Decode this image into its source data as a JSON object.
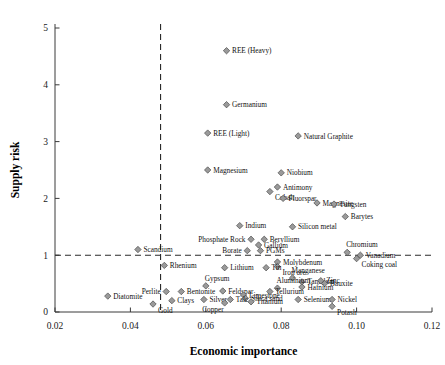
{
  "chart_data": {
    "type": "scatter",
    "title": "",
    "xlabel": "Economic importance",
    "ylabel": "Supply risk",
    "xlim": [
      0.02,
      0.12
    ],
    "ylim": [
      0,
      5
    ],
    "xticks": [
      0.02,
      0.04,
      0.06,
      0.08,
      0.1,
      0.12
    ],
    "xticklabels": [
      "0.02",
      "0.04",
      "0.06",
      "0.08",
      "0.10",
      "0.12"
    ],
    "yticks": [
      0,
      1,
      2,
      3,
      4,
      5
    ],
    "yticklabels": [
      "0",
      "1",
      "2",
      "3",
      "4",
      "5"
    ],
    "grid": false,
    "legend": "none",
    "marker": {
      "shape": "diamond",
      "fill": "#9a9a9a",
      "edge": "#4a4a4a"
    },
    "reference_lines": [
      {
        "orientation": "vertical",
        "value": 0.048,
        "style": "dashed"
      },
      {
        "orientation": "horizontal",
        "value": 1.0,
        "style": "dashed"
      }
    ],
    "points": [
      {
        "label": "REE (Heavy)",
        "x": 0.0655,
        "y": 4.6,
        "lab_pos": "right"
      },
      {
        "label": "Germanium",
        "x": 0.0655,
        "y": 3.65,
        "lab_pos": "right"
      },
      {
        "label": "REE (Light)",
        "x": 0.0605,
        "y": 3.15,
        "lab_pos": "right"
      },
      {
        "label": "Natural Graphite",
        "x": 0.0845,
        "y": 3.1,
        "lab_pos": "right"
      },
      {
        "label": "Magnesium",
        "x": 0.0605,
        "y": 2.5,
        "lab_pos": "right"
      },
      {
        "label": "Niobium",
        "x": 0.08,
        "y": 2.45,
        "lab_pos": "right"
      },
      {
        "label": "Antimony",
        "x": 0.079,
        "y": 2.2,
        "lab_pos": "right"
      },
      {
        "label": "Cobalt",
        "x": 0.077,
        "y": 2.12,
        "lab_pos": "belowright"
      },
      {
        "label": "Fluorspar",
        "x": 0.0805,
        "y": 2.0,
        "lab_pos": "right"
      },
      {
        "label": "Magnesite",
        "x": 0.0895,
        "y": 1.92,
        "lab_pos": "right"
      },
      {
        "label": "Tungsten",
        "x": 0.094,
        "y": 1.9,
        "lab_pos": "right"
      },
      {
        "label": "Barytes",
        "x": 0.097,
        "y": 1.68,
        "lab_pos": "right"
      },
      {
        "label": "Indium",
        "x": 0.069,
        "y": 1.52,
        "lab_pos": "right"
      },
      {
        "label": "Silicon metal",
        "x": 0.083,
        "y": 1.5,
        "lab_pos": "right"
      },
      {
        "label": "Phosphate Rock",
        "x": 0.072,
        "y": 1.28,
        "lab_pos": "left"
      },
      {
        "label": "Beryllium",
        "x": 0.0755,
        "y": 1.28,
        "lab_pos": "right"
      },
      {
        "label": "Gallium",
        "x": 0.074,
        "y": 1.18,
        "lab_pos": "right"
      },
      {
        "label": "Borate",
        "x": 0.071,
        "y": 1.08,
        "lab_pos": "left"
      },
      {
        "label": "PGMs",
        "x": 0.0745,
        "y": 1.08,
        "lab_pos": "right"
      },
      {
        "label": "Scandium",
        "x": 0.042,
        "y": 1.1,
        "lab_pos": "right"
      },
      {
        "label": "Chromium",
        "x": 0.0975,
        "y": 1.05,
        "lab_pos": "aboveright"
      },
      {
        "label": "Vanadium",
        "x": 0.101,
        "y": 1.0,
        "lab_pos": "right"
      },
      {
        "label": "Coking coal",
        "x": 0.1,
        "y": 0.94,
        "lab_pos": "belowright"
      },
      {
        "label": "Molybdenum",
        "x": 0.079,
        "y": 0.88,
        "lab_pos": "right"
      },
      {
        "label": "Iron ore",
        "x": 0.079,
        "y": 0.8,
        "lab_pos": "belowright"
      },
      {
        "label": "Tin",
        "x": 0.076,
        "y": 0.78,
        "lab_pos": "right"
      },
      {
        "label": "Rhenium",
        "x": 0.049,
        "y": 0.82,
        "lab_pos": "right"
      },
      {
        "label": "Lithium",
        "x": 0.065,
        "y": 0.78,
        "lab_pos": "right"
      },
      {
        "label": "Manganese",
        "x": 0.083,
        "y": 0.6,
        "lab_pos": "aboveright"
      },
      {
        "label": "Tantalum",
        "x": 0.0855,
        "y": 0.53,
        "lab_pos": "right"
      },
      {
        "label": "Zinc",
        "x": 0.0905,
        "y": 0.55,
        "lab_pos": "right"
      },
      {
        "label": "Bauxite",
        "x": 0.0915,
        "y": 0.5,
        "lab_pos": "right"
      },
      {
        "label": "Hafnium",
        "x": 0.0855,
        "y": 0.44,
        "lab_pos": "right"
      },
      {
        "label": "Aluminium",
        "x": 0.079,
        "y": 0.42,
        "lab_pos": "aboveright"
      },
      {
        "label": "Tellurium",
        "x": 0.077,
        "y": 0.36,
        "lab_pos": "right"
      },
      {
        "label": "Gypsum",
        "x": 0.06,
        "y": 0.46,
        "lab_pos": "aboveright"
      },
      {
        "label": "Feldspar",
        "x": 0.0645,
        "y": 0.37,
        "lab_pos": "right"
      },
      {
        "label": "Perlite",
        "x": 0.0495,
        "y": 0.36,
        "lab_pos": "left"
      },
      {
        "label": "Bentonite",
        "x": 0.0535,
        "y": 0.36,
        "lab_pos": "right"
      },
      {
        "label": "Limestone",
        "x": 0.07,
        "y": 0.3,
        "lab_pos": "right"
      },
      {
        "label": "Silica sand",
        "x": 0.0705,
        "y": 0.24,
        "lab_pos": "right"
      },
      {
        "label": "Silver",
        "x": 0.0595,
        "y": 0.22,
        "lab_pos": "right"
      },
      {
        "label": "Talc",
        "x": 0.0665,
        "y": 0.22,
        "lab_pos": "right"
      },
      {
        "label": "Clays",
        "x": 0.051,
        "y": 0.2,
        "lab_pos": "right"
      },
      {
        "label": "Copper",
        "x": 0.065,
        "y": 0.16,
        "lab_pos": "belowleft"
      },
      {
        "label": "Gold",
        "x": 0.046,
        "y": 0.14,
        "lab_pos": "belowright"
      },
      {
        "label": "Titanium",
        "x": 0.072,
        "y": 0.18,
        "lab_pos": "right"
      },
      {
        "label": "Diatomite",
        "x": 0.034,
        "y": 0.28,
        "lab_pos": "right"
      },
      {
        "label": "Selenium",
        "x": 0.0845,
        "y": 0.22,
        "lab_pos": "right"
      },
      {
        "label": "Nickel",
        "x": 0.0935,
        "y": 0.22,
        "lab_pos": "right"
      },
      {
        "label": "Potash",
        "x": 0.0935,
        "y": 0.1,
        "lab_pos": "belowright"
      }
    ]
  }
}
